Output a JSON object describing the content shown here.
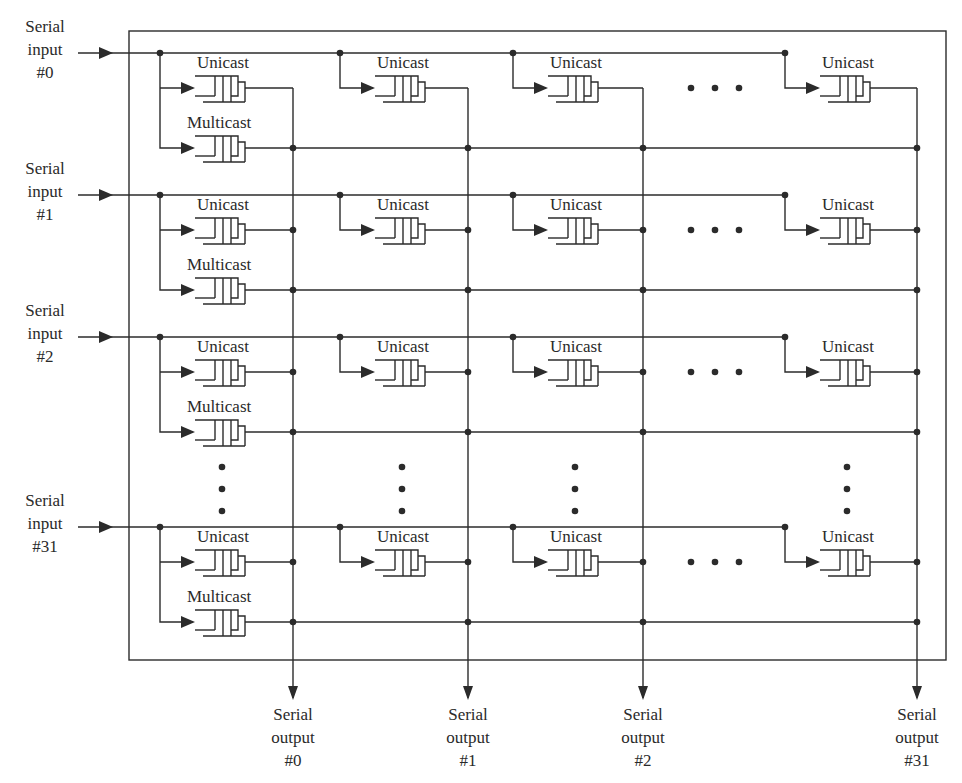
{
  "diagram": {
    "type": "crossbar-switch-architecture",
    "colors": {
      "line": "#2b2b2b",
      "background": "#ffffff",
      "text": "#2a2a2a"
    },
    "frame": {
      "x": 129,
      "y": 31,
      "width": 817,
      "height": 629
    },
    "queue_labels": {
      "unicast": "Unicast",
      "multicast": "Multicast"
    },
    "ellipsis": "• • •",
    "inputs": [
      {
        "id": "in0",
        "lines": [
          "Serial",
          "input",
          "#0"
        ],
        "y": 53
      },
      {
        "id": "in1",
        "lines": [
          "Serial",
          "input",
          "#1"
        ],
        "y": 195
      },
      {
        "id": "in2",
        "lines": [
          "Serial",
          "input",
          "#2"
        ],
        "y": 337
      },
      {
        "id": "in31",
        "lines": [
          "Serial",
          "input",
          "#31"
        ],
        "y": 527
      }
    ],
    "outputs": [
      {
        "id": "out0",
        "lines": [
          "Serial",
          "output",
          "#0"
        ],
        "x": 293
      },
      {
        "id": "out1",
        "lines": [
          "Serial",
          "output",
          "#1"
        ],
        "x": 468
      },
      {
        "id": "out2",
        "lines": [
          "Serial",
          "output",
          "#2"
        ],
        "x": 643
      },
      {
        "id": "out31",
        "lines": [
          "Serial",
          "output",
          "#31"
        ],
        "x": 917
      }
    ],
    "column_branch_x": [
      160,
      340,
      513,
      785
    ],
    "queue_x": [
      195,
      375,
      548,
      820
    ],
    "ellipsis_x": 715,
    "vertical_ellipsis_y": 480,
    "rows_description": "Each serial input feeds a Unicast queue per output column and one shared Multicast queue; the Multicast queue output fans out to all serial outputs."
  }
}
